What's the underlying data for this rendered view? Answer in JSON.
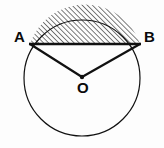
{
  "figure": {
    "kind": "circle-segment-geometry-diagram",
    "background_color": "#fdfdfd",
    "stroke_color": "#111111",
    "hatch_color": "#111111",
    "circle": {
      "center_x": 82,
      "center_y": 78,
      "radius": 58,
      "outline_width": 1.2
    },
    "chord": {
      "name": "AB",
      "y": 44,
      "x_start": 30,
      "x_end": 140,
      "width": 2.6
    },
    "radii": [
      {
        "name": "OA",
        "from": "O",
        "to": "A",
        "width": 2.2
      },
      {
        "name": "OB",
        "from": "O",
        "to": "B",
        "width": 2.2
      }
    ],
    "center_dot": {
      "x": 82,
      "y": 77,
      "radius": 2.2
    },
    "hatching": {
      "region": "minor-segment-above-chord",
      "direction": "forward-slash",
      "spacing": 3.6,
      "line_width": 1.1
    },
    "labels": {
      "point_a": "A",
      "point_b": "B",
      "center": "O"
    },
    "label_positions": {
      "point_a": {
        "x": 14,
        "y": 42
      },
      "point_b": {
        "x": 144,
        "y": 42
      },
      "center": {
        "x": 77,
        "y": 93
      }
    }
  }
}
